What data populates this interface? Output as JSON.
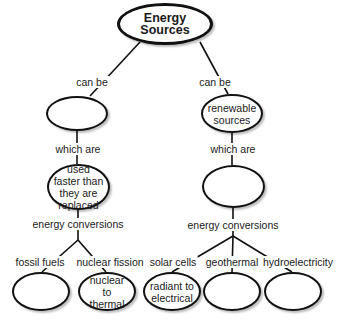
{
  "title": "Energy Sources",
  "left_branch": {
    "link1": "can be",
    "node1": "",
    "link2": "which are",
    "node2": "used faster than they are replaced",
    "link3": "energy conversions",
    "children": [
      {
        "link": "fossil fuels",
        "node": ""
      },
      {
        "link": "nuclear fission",
        "node": "nuclear to thermal"
      }
    ]
  },
  "right_branch": {
    "link1": "can be",
    "node1": "renewable sources",
    "link2": "which are",
    "node2": "",
    "link3": "energy conversions",
    "children": [
      {
        "link": "solar cells",
        "node": "radiant to electrical"
      },
      {
        "link": "geothermal",
        "node": ""
      },
      {
        "link": "hydroelectricity",
        "node": ""
      }
    ]
  }
}
